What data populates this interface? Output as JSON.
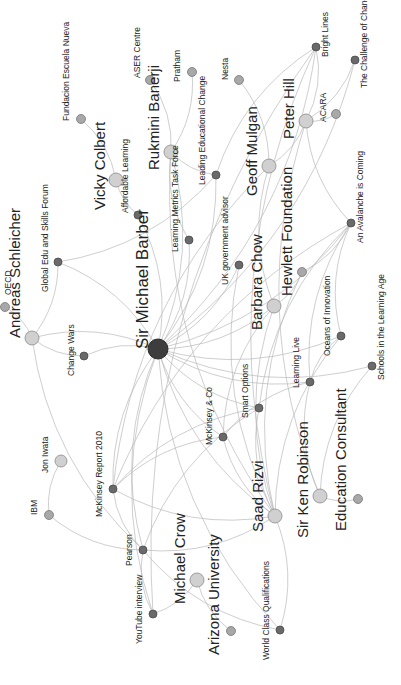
{
  "diagram": {
    "type": "network-graph",
    "orientation": "rotated-90-ccw",
    "colors": {
      "hub": "#3d3d3d",
      "person": "#d0d0d0",
      "organization": "#a8a8a8",
      "item": "#6a6a6a",
      "edge": "#b9b9b9"
    },
    "nodes": [
      {
        "id": "smb",
        "label": "Sir Michael Barber",
        "kind": "hub",
        "x": 158,
        "y": 349,
        "r": 10,
        "size": "lg",
        "lx": -10,
        "ly": 0
      },
      {
        "id": "andreas",
        "label": "Andreas Schleicher",
        "kind": "person",
        "x": 32,
        "y": 338,
        "r": 7,
        "size": "md",
        "lx": -12,
        "ly": 0
      },
      {
        "id": "oecd",
        "label": "OECD",
        "kind": "org",
        "x": 5,
        "y": 307,
        "r": 4.5,
        "size": "sm",
        "lx": 6,
        "ly": -12
      },
      {
        "id": "globaledu",
        "label": "Global Edu and Skills Forum",
        "kind": "item",
        "x": 58,
        "y": 262,
        "r": 4,
        "size": "sm",
        "lx": -10,
        "ly": 30
      },
      {
        "id": "changewars",
        "label": "Change Wars",
        "kind": "item",
        "x": 84,
        "y": 356,
        "r": 4,
        "size": "sm",
        "lx": -10,
        "ly": 20
      },
      {
        "id": "vicky",
        "label": "Vicky Colbert",
        "kind": "person",
        "x": 116,
        "y": 180,
        "r": 7,
        "size": "md",
        "lx": -11,
        "ly": 30
      },
      {
        "id": "fundacion",
        "label": "Fundacion Escuela Nueva",
        "kind": "org",
        "x": 81,
        "y": 119,
        "r": 4.5,
        "size": "sm",
        "lx": -12,
        "ly": 2
      },
      {
        "id": "affordable",
        "label": "Affordable Learning",
        "kind": "item",
        "x": 138,
        "y": 215,
        "r": 4,
        "size": "sm",
        "lx": -10,
        "ly": -2
      },
      {
        "id": "rukmini",
        "label": "Rukmini Banerji",
        "kind": "person",
        "x": 171,
        "y": 152,
        "r": 7,
        "size": "md",
        "lx": -12,
        "ly": 18
      },
      {
        "id": "aser",
        "label": "ASER Centre",
        "kind": "org",
        "x": 150,
        "y": 80,
        "r": 4.5,
        "size": "sm",
        "lx": -10,
        "ly": -2
      },
      {
        "id": "pratham",
        "label": "Pratham",
        "kind": "org",
        "x": 192,
        "y": 72,
        "r": 4.5,
        "size": "sm",
        "lx": -12,
        "ly": 10
      },
      {
        "id": "lmtf",
        "label": "Learning Metrics Task Force",
        "kind": "item",
        "x": 189,
        "y": 240,
        "r": 4,
        "size": "sm",
        "lx": -11,
        "ly": 12
      },
      {
        "id": "lec",
        "label": "Leading Educational Change",
        "kind": "item",
        "x": 216,
        "y": 175,
        "r": 4,
        "size": "sm",
        "lx": -11,
        "ly": 10
      },
      {
        "id": "nesta",
        "label": "Nesta",
        "kind": "org",
        "x": 239,
        "y": 80,
        "r": 4.5,
        "size": "sm",
        "lx": -11,
        "ly": 0
      },
      {
        "id": "geoff",
        "label": "Geoff Mulgan",
        "kind": "person",
        "x": 269,
        "y": 166,
        "r": 7,
        "size": "md",
        "lx": -12,
        "ly": 30
      },
      {
        "id": "peterhill",
        "label": "Peter Hill",
        "kind": "person",
        "x": 306,
        "y": 121,
        "r": 7,
        "size": "md",
        "lx": -12,
        "ly": 18
      },
      {
        "id": "acara",
        "label": "ACARA",
        "kind": "org",
        "x": 336,
        "y": 114,
        "r": 4.5,
        "size": "sm",
        "lx": -10,
        "ly": 8
      },
      {
        "id": "brightlines",
        "label": "Bright Lines",
        "kind": "item",
        "x": 316,
        "y": 47,
        "r": 4,
        "size": "sm",
        "lx": 12,
        "ly": 10
      },
      {
        "id": "challenge",
        "label": "The Challenge of Change",
        "kind": "item",
        "x": 355,
        "y": 60,
        "r": 4,
        "size": "sm",
        "lx": 12,
        "ly": 28
      },
      {
        "id": "ukgov",
        "label": "UK government advisor",
        "kind": "item",
        "x": 239,
        "y": 265,
        "r": 4,
        "size": "sm",
        "lx": -11,
        "ly": 20
      },
      {
        "id": "barbara",
        "label": "Barbara Chow",
        "kind": "person",
        "x": 274,
        "y": 306,
        "r": 7,
        "size": "md",
        "lx": -12,
        "ly": 24
      },
      {
        "id": "hewlett",
        "label": "Hewlett Foundation",
        "kind": "org",
        "x": 302,
        "y": 272,
        "r": 4.5,
        "size": "sm",
        "lx": -10,
        "ly": 24,
        "labelSize": "md"
      },
      {
        "id": "avalanche",
        "label": "An Avalanche is Coming",
        "kind": "item",
        "x": 351,
        "y": 223,
        "r": 4,
        "size": "sm",
        "lx": 12,
        "ly": 20
      },
      {
        "id": "oceans",
        "label": "Oceans of Innovation",
        "kind": "item",
        "x": 341,
        "y": 336,
        "r": 4,
        "size": "sm",
        "lx": -11,
        "ly": 20
      },
      {
        "id": "schools",
        "label": "Schools in the Learning Age",
        "kind": "item",
        "x": 372,
        "y": 366,
        "r": 4,
        "size": "sm",
        "lx": 12,
        "ly": 14
      },
      {
        "id": "learninglive",
        "label": "Learning Live",
        "kind": "item",
        "x": 310,
        "y": 382,
        "r": 4,
        "size": "sm",
        "lx": -11,
        "ly": 6
      },
      {
        "id": "smartoptions",
        "label": "Smart Options",
        "kind": "item",
        "x": 259,
        "y": 408,
        "r": 4,
        "size": "sm",
        "lx": -11,
        "ly": 10
      },
      {
        "id": "mckco",
        "label": "McKinsey & Co",
        "kind": "item",
        "x": 223,
        "y": 437,
        "r": 4,
        "size": "sm",
        "lx": -11,
        "ly": 8
      },
      {
        "id": "saad",
        "label": "Saad Rizvi",
        "kind": "person",
        "x": 275,
        "y": 516,
        "r": 7,
        "size": "md",
        "lx": -12,
        "ly": 16
      },
      {
        "id": "kenrobinson",
        "label": "Sir Ken Robinson",
        "kind": "person",
        "x": 320,
        "y": 496,
        "r": 7,
        "size": "md",
        "lx": -12,
        "ly": 42
      },
      {
        "id": "educonsultant",
        "label": "Education Consultant",
        "kind": "org",
        "x": 358,
        "y": 499,
        "r": 4.5,
        "size": "sm",
        "lx": -12,
        "ly": 32,
        "labelSize": "md"
      },
      {
        "id": "jon",
        "label": "Jon Iwata",
        "kind": "person",
        "x": 61,
        "y": 461,
        "r": 6,
        "size": "sm",
        "lx": -13,
        "ly": 12
      },
      {
        "id": "ibm",
        "label": "IBM",
        "kind": "org",
        "x": 49,
        "y": 515,
        "r": 4.5,
        "size": "sm",
        "lx": -12,
        "ly": 0
      },
      {
        "id": "mckreport",
        "label": "McKinsey Report 2010",
        "kind": "item",
        "x": 113,
        "y": 489,
        "r": 4,
        "size": "sm",
        "lx": -11,
        "ly": 28
      },
      {
        "id": "pearson",
        "label": "Pearson",
        "kind": "item",
        "x": 143,
        "y": 550,
        "r": 4,
        "size": "sm",
        "lx": -11,
        "ly": 16
      },
      {
        "id": "youtube",
        "label": "YouTube interview",
        "kind": "item",
        "x": 153,
        "y": 614,
        "r": 4,
        "size": "sm",
        "lx": -11,
        "ly": 30
      },
      {
        "id": "michaelcrow",
        "label": "Michael Crow",
        "kind": "person",
        "x": 197,
        "y": 580,
        "r": 7,
        "size": "md",
        "lx": -12,
        "ly": 24
      },
      {
        "id": "arizona",
        "label": "Arizona University",
        "kind": "org",
        "x": 231,
        "y": 631,
        "r": 4.5,
        "size": "sm",
        "lx": -12,
        "ly": 24,
        "labelSize": "md"
      },
      {
        "id": "worldclass",
        "label": "World Class Qualifications",
        "kind": "item",
        "x": 280,
        "y": 630,
        "r": 4,
        "size": "sm",
        "lx": -11,
        "ly": 30
      }
    ],
    "edges": [
      [
        "smb",
        "andreas"
      ],
      [
        "smb",
        "globaledu"
      ],
      [
        "smb",
        "changewars"
      ],
      [
        "smb",
        "affordable"
      ],
      [
        "smb",
        "rukmini"
      ],
      [
        "smb",
        "lmtf"
      ],
      [
        "smb",
        "lec"
      ],
      [
        "smb",
        "brightlines"
      ],
      [
        "smb",
        "challenge"
      ],
      [
        "smb",
        "ukgov"
      ],
      [
        "smb",
        "avalanche"
      ],
      [
        "smb",
        "oceans"
      ],
      [
        "smb",
        "schools"
      ],
      [
        "smb",
        "learninglive"
      ],
      [
        "smb",
        "smartoptions"
      ],
      [
        "smb",
        "mckco"
      ],
      [
        "smb",
        "mckreport"
      ],
      [
        "smb",
        "pearson"
      ],
      [
        "smb",
        "youtube"
      ],
      [
        "smb",
        "worldclass"
      ],
      [
        "smb",
        "barbara"
      ],
      [
        "smb",
        "saad"
      ],
      [
        "andreas",
        "oecd"
      ],
      [
        "andreas",
        "globaledu"
      ],
      [
        "andreas",
        "changewars"
      ],
      [
        "andreas",
        "pearson"
      ],
      [
        "vicky",
        "fundacion"
      ],
      [
        "vicky",
        "affordable"
      ],
      [
        "globaledu",
        "lec"
      ],
      [
        "rukmini",
        "aser"
      ],
      [
        "rukmini",
        "pratham"
      ],
      [
        "rukmini",
        "lmtf"
      ],
      [
        "rukmini",
        "lec"
      ],
      [
        "rukmini",
        "saad"
      ],
      [
        "geoff",
        "nesta"
      ],
      [
        "geoff",
        "peterhill"
      ],
      [
        "geoff",
        "barbara"
      ],
      [
        "geoff",
        "mckreport"
      ],
      [
        "peterhill",
        "acara"
      ],
      [
        "peterhill",
        "brightlines"
      ],
      [
        "peterhill",
        "avalanche"
      ],
      [
        "peterhill",
        "challenge"
      ],
      [
        "peterhill",
        "kenrobinson"
      ],
      [
        "brightlines",
        "lec"
      ],
      [
        "brightlines",
        "youtube"
      ],
      [
        "brightlines",
        "saad"
      ],
      [
        "ukgov",
        "saad"
      ],
      [
        "barbara",
        "hewlett"
      ],
      [
        "barbara",
        "saad"
      ],
      [
        "barbara",
        "mckco"
      ],
      [
        "hewlett",
        "avalanche"
      ],
      [
        "hewlett",
        "saad"
      ],
      [
        "avalanche",
        "mckreport"
      ],
      [
        "avalanche",
        "smartoptions"
      ],
      [
        "avalanche",
        "learninglive"
      ],
      [
        "avalanche",
        "oceans"
      ],
      [
        "oceans",
        "saad"
      ],
      [
        "oceans",
        "learninglive"
      ],
      [
        "schools",
        "kenrobinson"
      ],
      [
        "learninglive",
        "kenrobinson"
      ],
      [
        "learninglive",
        "mckco"
      ],
      [
        "smartoptions",
        "saad"
      ],
      [
        "smartoptions",
        "mckreport"
      ],
      [
        "smartoptions",
        "pearson"
      ],
      [
        "mckco",
        "saad"
      ],
      [
        "mckco",
        "mckreport"
      ],
      [
        "kenrobinson",
        "educonsultant"
      ],
      [
        "jon",
        "ibm"
      ],
      [
        "ibm",
        "pearson"
      ],
      [
        "mckreport",
        "pearson"
      ],
      [
        "mckreport",
        "saad"
      ],
      [
        "pearson",
        "saad"
      ],
      [
        "pearson",
        "worldclass"
      ],
      [
        "pearson",
        "youtube"
      ],
      [
        "youtube",
        "michaelcrow"
      ],
      [
        "michaelcrow",
        "arizona"
      ],
      [
        "worldclass",
        "saad"
      ]
    ]
  }
}
